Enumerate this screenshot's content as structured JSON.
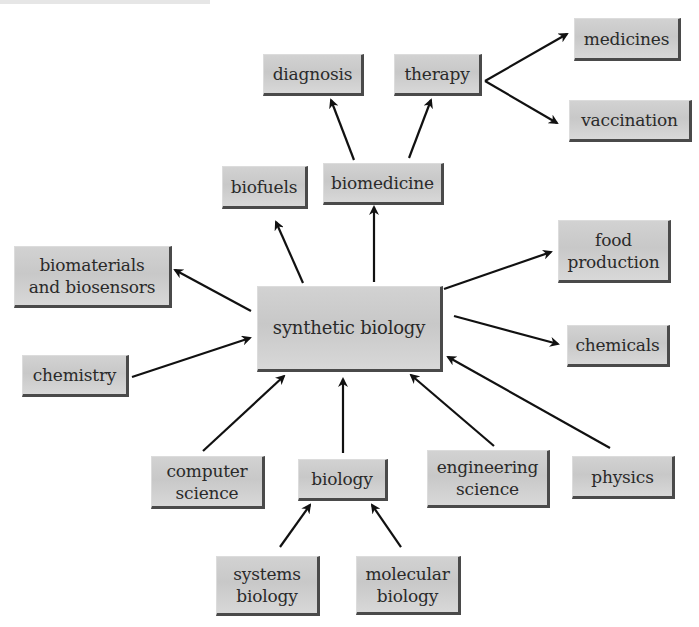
{
  "diagram": {
    "type": "concept-map",
    "central_node": "synthetic biology",
    "colors": {
      "box_fill": "#cccccc",
      "box_shadow": "#4a4a4a",
      "text": "#2a2a2a",
      "arrow": "#111111"
    },
    "nodes": {
      "synthetic_biology": {
        "label": "synthetic biology",
        "x": 257,
        "y": 286,
        "w": 186,
        "h": 86
      },
      "diagnosis": {
        "label": "diagnosis",
        "x": 263,
        "y": 54,
        "w": 101,
        "h": 42
      },
      "therapy": {
        "label": "therapy",
        "x": 394,
        "y": 54,
        "w": 88,
        "h": 42
      },
      "medicines": {
        "label": "medicines",
        "x": 574,
        "y": 18,
        "w": 107,
        "h": 43
      },
      "vaccination": {
        "label": "vaccination",
        "x": 569,
        "y": 100,
        "w": 123,
        "h": 42
      },
      "biofuels": {
        "label": "biofuels",
        "x": 222,
        "y": 166,
        "w": 86,
        "h": 43
      },
      "biomedicine": {
        "label": "biomedicine",
        "x": 323,
        "y": 163,
        "w": 121,
        "h": 42
      },
      "biomaterials": {
        "label": "biomaterials\nand biosensors",
        "x": 14,
        "y": 246,
        "w": 158,
        "h": 62
      },
      "food_production": {
        "label": "food\nproduction",
        "x": 558,
        "y": 220,
        "w": 113,
        "h": 63
      },
      "chemistry": {
        "label": "chemistry",
        "x": 22,
        "y": 355,
        "w": 107,
        "h": 42
      },
      "chemicals": {
        "label": "chemicals",
        "x": 567,
        "y": 325,
        "w": 103,
        "h": 42
      },
      "computer_science": {
        "label": "computer\nscience",
        "x": 151,
        "y": 456,
        "w": 114,
        "h": 53
      },
      "biology": {
        "label": "biology",
        "x": 298,
        "y": 459,
        "w": 90,
        "h": 42
      },
      "engineering_science": {
        "label": "engineering\nscience",
        "x": 427,
        "y": 450,
        "w": 123,
        "h": 58
      },
      "physics": {
        "label": "physics",
        "x": 572,
        "y": 456,
        "w": 103,
        "h": 43
      },
      "systems_biology": {
        "label": "systems\nbiology",
        "x": 216,
        "y": 556,
        "w": 104,
        "h": 60
      },
      "molecular_biology": {
        "label": "molecular\nbiology",
        "x": 356,
        "y": 556,
        "w": 105,
        "h": 59
      }
    },
    "edges": [
      {
        "from": "synthetic_biology",
        "to": "biofuels",
        "x1": 303,
        "y1": 283,
        "x2": 276,
        "y2": 222
      },
      {
        "from": "synthetic_biology",
        "to": "biomedicine",
        "x1": 374,
        "y1": 282,
        "x2": 374,
        "y2": 207
      },
      {
        "from": "biomedicine",
        "to": "diagnosis",
        "x1": 354,
        "y1": 160,
        "x2": 331,
        "y2": 100
      },
      {
        "from": "biomedicine",
        "to": "therapy",
        "x1": 409,
        "y1": 158,
        "x2": 431,
        "y2": 100
      },
      {
        "from": "therapy",
        "to": "medicines",
        "x1": 485,
        "y1": 81,
        "x2": 567,
        "y2": 34
      },
      {
        "from": "therapy",
        "to": "vaccination",
        "x1": 485,
        "y1": 81,
        "x2": 557,
        "y2": 123
      },
      {
        "from": "synthetic_biology",
        "to": "biomaterials",
        "x1": 251,
        "y1": 311,
        "x2": 175,
        "y2": 270
      },
      {
        "from": "synthetic_biology",
        "to": "food_production",
        "x1": 444,
        "y1": 289,
        "x2": 551,
        "y2": 252
      },
      {
        "from": "chemistry",
        "to": "synthetic_biology",
        "x1": 132,
        "y1": 377,
        "x2": 250,
        "y2": 338
      },
      {
        "from": "synthetic_biology",
        "to": "chemicals",
        "x1": 454,
        "y1": 316,
        "x2": 558,
        "y2": 344
      },
      {
        "from": "computer_science",
        "to": "synthetic_biology",
        "x1": 203,
        "y1": 451,
        "x2": 284,
        "y2": 376
      },
      {
        "from": "biology",
        "to": "synthetic_biology",
        "x1": 343,
        "y1": 453,
        "x2": 343,
        "y2": 379
      },
      {
        "from": "engineering_science",
        "to": "synthetic_biology",
        "x1": 494,
        "y1": 446,
        "x2": 411,
        "y2": 375
      },
      {
        "from": "physics",
        "to": "synthetic_biology",
        "x1": 610,
        "y1": 448,
        "x2": 448,
        "y2": 357
      },
      {
        "from": "systems_biology",
        "to": "biology",
        "x1": 280,
        "y1": 547,
        "x2": 310,
        "y2": 505
      },
      {
        "from": "molecular_biology",
        "to": "biology",
        "x1": 401,
        "y1": 547,
        "x2": 372,
        "y2": 505
      }
    ]
  }
}
